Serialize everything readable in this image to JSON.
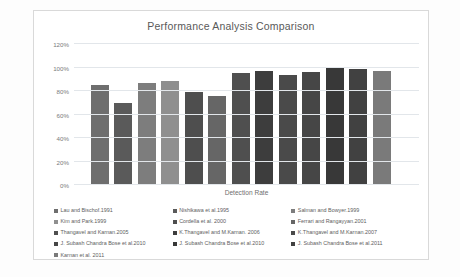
{
  "chart_data": {
    "type": "bar",
    "title": "Performance Analysis Comparison",
    "xlabel": "Detection Rate",
    "ylabel": "",
    "ylim": [
      0,
      120
    ],
    "ytick_labels": [
      "120%",
      "100%",
      "80%",
      "60%",
      "40%",
      "20%",
      "0%"
    ],
    "ytick_values": [
      120,
      100,
      80,
      60,
      40,
      20,
      0
    ],
    "grid": true,
    "legend_position": "bottom",
    "categories": [
      "Lau and Bischof.1991",
      "Nishikawa et al.1995",
      "Salman and Bowyer.1999",
      "Kim and Park.1999",
      "Cordella et al. 2000",
      "Ferrari and Rangayyan.2001",
      "Thangavel and Karnan.2005",
      "K.Thangavel and M.Karnan. 2006",
      "K.Thangavel and M.Karnan.2007",
      "J. Subash Chandra Bose et al.2010",
      "J. Subash Chandra Bose et al.2010",
      "J. Subash Chandra Bose et al.2011",
      "Karnan et al. 2011"
    ],
    "values": [
      85,
      70,
      87,
      88.5,
      79,
      75.5,
      95,
      97,
      94,
      96,
      100,
      98.5,
      97
    ],
    "colors": [
      "#6e6e6e",
      "#5a5a5a",
      "#7d7d7d",
      "#8f8f8f",
      "#4e4e4e",
      "#666666",
      "#4f4f4f",
      "#3d3d3d",
      "#4a4a4a",
      "#464646",
      "#383838",
      "#414141",
      "#7a7a7a"
    ],
    "series_labels": [
      "Lau and Bischof.1991",
      "Nishikawa et al.1995",
      "Salman and Bowyer.1999",
      "Kim and Park.1999",
      "Cordella et al. 2000",
      "Ferrari and Rangayyan.2001",
      "Thangavel and Karnan.2005",
      "K.Thangavel and M.Karnan. 2006",
      "K.Thangavel and M.Karnan.2007",
      "J. Subash Chandra Bose et al.2010",
      "J. Subash Chandra Bose et al.2010",
      "J. Subash Chandra Bose et al.2011",
      "Karnan et al. 2011"
    ]
  },
  "legend": {
    "items": [
      {
        "label": "Lau and Bischof.1991",
        "color": "#6e6e6e"
      },
      {
        "label": "Nishikawa et al.1995",
        "color": "#5a5a5a"
      },
      {
        "label": "Salman and Bowyer.1999",
        "color": "#7d7d7d"
      },
      {
        "label": "Kim and Park.1999",
        "color": "#8f8f8f"
      },
      {
        "label": "Cordella et al. 2000",
        "color": "#4e4e4e"
      },
      {
        "label": "Ferrari and Rangayyan.2001",
        "color": "#666666"
      },
      {
        "label": "Thangavel and Karnan.2005",
        "color": "#4f4f4f"
      },
      {
        "label": "K.Thangavel and M.Karnan. 2006",
        "color": "#3d3d3d"
      },
      {
        "label": "K.Thangavel and M.Karnan.2007",
        "color": "#4a4a4a"
      },
      {
        "label": "J. Subash Chandra Bose et al.2010",
        "color": "#464646"
      },
      {
        "label": "J. Subash Chandra Bose et al.2010",
        "color": "#383838"
      },
      {
        "label": "J. Subash Chandra Bose et al.2011",
        "color": "#414141"
      },
      {
        "label": "Karnan et al. 2011",
        "color": "#7a7a7a"
      }
    ]
  }
}
